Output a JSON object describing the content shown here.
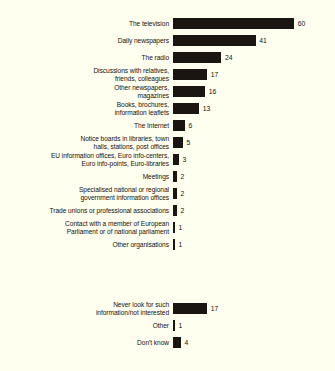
{
  "chart_data": {
    "type": "bar",
    "orientation": "horizontal",
    "title": "",
    "xlabel": "",
    "ylabel": "",
    "xlim": [
      0,
      60
    ],
    "grid": false,
    "legend": null,
    "units": "%",
    "colors": {
      "bar": "#1a1510",
      "background": "#fffff0",
      "text": "#14100c"
    },
    "groups": [
      {
        "name": "sources-of-information",
        "categories": [
          "The television",
          "Daily newspapers",
          "The radio",
          "Discussions with relatives,\nfriends, colleagues",
          "Other newspapers,\nmagazines",
          "Books, brochures,\ninformation leaflets",
          "The Internet",
          "Notice boards in libraries, town\nhalls, stations, post offices",
          "EU information offices, Euro info-centers,\nEuro info-points, Euro-libraries",
          "Meetings",
          "Specialised national or regional\ngovernment information offices",
          "Trade unions or professional associations",
          "Contact with a member of European\nParliament or of national parliament",
          "Other organisations"
        ],
        "values": [
          60,
          41,
          24,
          17,
          16,
          13,
          6,
          5,
          3,
          2,
          2,
          2,
          1,
          1
        ]
      },
      {
        "name": "non-seekers",
        "categories": [
          "Never look for such\ninformation/not interested",
          "Other",
          "Don't know"
        ],
        "values": [
          17,
          1,
          4
        ]
      }
    ]
  },
  "layout": {
    "bar_origin_x": 176,
    "px_per_unit": 2.02,
    "row_pitch": 17,
    "group1_top": 15,
    "group2_top": 300
  }
}
